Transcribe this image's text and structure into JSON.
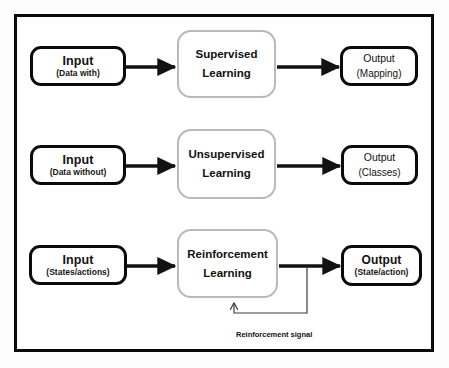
{
  "diagram": {
    "background_color": "#ffffff",
    "frame_color": "#0a0a0a",
    "box_border_color": "#0b0b0b",
    "algo_border_color": "#b9b9b9",
    "arrow_color": "#121212",
    "loop_color": "#3a3a3a"
  },
  "rows": [
    {
      "id": "supervised",
      "input": {
        "title": "Input",
        "sub": "(Data with)"
      },
      "process": {
        "line1": "Supervised",
        "line2": "Learning"
      },
      "output": {
        "title": "Output",
        "sub": "(Mapping)"
      }
    },
    {
      "id": "unsupervised",
      "input": {
        "title": "Input",
        "sub": "(Data without)"
      },
      "process": {
        "line1": "Unsupervised",
        "line2": "Learning"
      },
      "output": {
        "title": "Output",
        "sub": "(Classes)"
      }
    },
    {
      "id": "reinforcement",
      "input": {
        "title": "Input",
        "sub": "(States/actions)"
      },
      "process": {
        "line1": "Reinforcement",
        "line2": "Learning"
      },
      "output": {
        "title": "Output",
        "sub": "(State/action)"
      }
    }
  ],
  "feedback": {
    "label": "Reinforcement signal"
  }
}
